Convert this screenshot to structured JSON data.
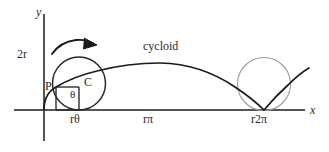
{
  "figure": {
    "labels": {
      "y_axis": "y",
      "x_axis": "x",
      "two_r": "2r",
      "point_p": "P",
      "point_c": "C",
      "angle_theta": "θ",
      "arc_length_rtheta": "rθ",
      "half_arch_rpi": "rπ",
      "full_arch_r2pi": "r2π",
      "curve_name": "cycloid"
    },
    "colors": {
      "axis": "#555555",
      "curve": "#1a1a1a",
      "rolling_circle": "#2b2b2b",
      "ghost_circle": "#9a9a9a",
      "text": "#2b2b2b",
      "background": "#ffffff"
    },
    "geometry": {
      "origin": [
        44,
        110
      ],
      "radius": 26,
      "rolling_circle_center": [
        79,
        83
      ],
      "ghost_circle_center": [
        264,
        84
      ],
      "point_p": [
        56,
        87
      ],
      "x_axis_y": 110,
      "y_axis_x": 44,
      "arch_apex": [
        158,
        63
      ]
    }
  }
}
